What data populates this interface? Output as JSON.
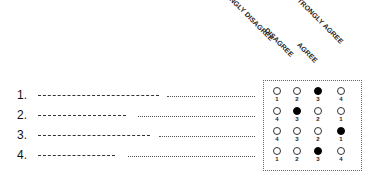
{
  "scale": {
    "labels": [
      "STRONGLY DISAGREE",
      "DISAGREE",
      "AGREE",
      "STRONGLY AGREE"
    ]
  },
  "questions": [
    {
      "number": "1.",
      "answers": [
        {
          "value": "1",
          "selected": false
        },
        {
          "value": "2",
          "selected": false
        },
        {
          "value": "3",
          "selected": true
        },
        {
          "value": "4",
          "selected": false
        }
      ]
    },
    {
      "number": "2.",
      "answers": [
        {
          "value": "4",
          "selected": false
        },
        {
          "value": "3",
          "selected": true
        },
        {
          "value": "2",
          "selected": false
        },
        {
          "value": "1",
          "selected": false
        }
      ]
    },
    {
      "number": "3.",
      "answers": [
        {
          "value": "4",
          "selected": false
        },
        {
          "value": "3",
          "selected": false
        },
        {
          "value": "2",
          "selected": false
        },
        {
          "value": "1",
          "selected": true
        }
      ]
    },
    {
      "number": "4.",
      "answers": [
        {
          "value": "1",
          "selected": false
        },
        {
          "value": "2",
          "selected": false
        },
        {
          "value": "3",
          "selected": true
        },
        {
          "value": "4",
          "selected": false
        }
      ]
    }
  ]
}
